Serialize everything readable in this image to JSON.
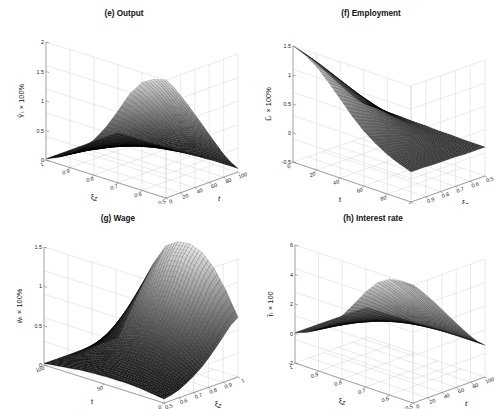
{
  "figure": {
    "background": "#ffffff",
    "panel_count": 4,
    "line_color": "#000000"
  },
  "chart_data": [
    {
      "type": "surface",
      "panel_id": "e",
      "title": "(e) Output",
      "zlabel": "Ŷₜ × 100%",
      "zticks": [
        0,
        0.5,
        1,
        1.5,
        2
      ],
      "zlim": [
        0,
        2
      ],
      "xlabel": "ξ_Z",
      "xticks": [
        1,
        0.9,
        0.8,
        0.7,
        0.6,
        0.5
      ],
      "xlim": [
        1,
        0.5
      ],
      "ylabel": "t",
      "yticks": [
        0,
        20,
        40,
        60,
        80,
        100
      ],
      "ylim": [
        0,
        100
      ],
      "orientation": "xi-left-t-right",
      "description": "Impulse response surface rising steeply from 0 to about 2 as xi_Z decreases toward 0.5, decaying over t",
      "surface_z": [
        [
          0.02,
          0.02,
          0.02,
          0.02,
          0.02,
          0.02,
          0.02,
          0.02,
          0.02,
          0.02,
          0.02
        ],
        [
          0.11,
          0.1,
          0.09,
          0.08,
          0.07,
          0.06,
          0.05,
          0.04,
          0.03,
          0.02,
          0.02
        ],
        [
          0.23,
          0.21,
          0.19,
          0.17,
          0.14,
          0.12,
          0.1,
          0.07,
          0.05,
          0.03,
          0.02
        ],
        [
          0.39,
          0.36,
          0.32,
          0.28,
          0.24,
          0.2,
          0.16,
          0.12,
          0.08,
          0.05,
          0.02
        ],
        [
          0.6,
          0.55,
          0.49,
          0.43,
          0.37,
          0.31,
          0.24,
          0.18,
          0.12,
          0.07,
          0.03
        ],
        [
          0.88,
          0.8,
          0.72,
          0.63,
          0.54,
          0.45,
          0.35,
          0.26,
          0.17,
          0.09,
          0.03
        ],
        [
          1.22,
          1.12,
          1.0,
          0.88,
          0.75,
          0.62,
          0.49,
          0.36,
          0.24,
          0.13,
          0.04
        ],
        [
          1.58,
          1.45,
          1.3,
          1.14,
          0.98,
          0.81,
          0.64,
          0.47,
          0.31,
          0.16,
          0.05
        ],
        [
          1.83,
          1.68,
          1.51,
          1.33,
          1.14,
          0.94,
          0.74,
          0.55,
          0.36,
          0.19,
          0.06
        ],
        [
          1.95,
          1.79,
          1.61,
          1.41,
          1.21,
          1.0,
          0.79,
          0.58,
          0.38,
          0.2,
          0.06
        ],
        [
          2.0,
          1.84,
          1.65,
          1.45,
          1.24,
          1.03,
          0.81,
          0.6,
          0.39,
          0.21,
          0.06
        ]
      ]
    },
    {
      "type": "surface",
      "panel_id": "f",
      "title": "(f) Employment",
      "zlabel": "L̂ₜ × 100%",
      "zticks": [
        -0.5,
        0,
        0.5,
        1,
        1.5
      ],
      "zlim": [
        -0.5,
        1.5
      ],
      "xlabel": "t",
      "xticks": [
        0,
        20,
        40,
        60,
        80,
        100
      ],
      "xlim": [
        0,
        100
      ],
      "ylabel": "ξ_Z",
      "yticks": [
        1,
        0.9,
        0.8,
        0.7,
        0.6,
        0.5
      ],
      "ylim": [
        1,
        0.5
      ],
      "orientation": "t-left-xi-right",
      "description": "Employment response surface peaking near 1.5 at early t and low xi_Z, flattening to near zero",
      "surface_z": [
        [
          1.5,
          1.38,
          1.24,
          1.09,
          0.93,
          0.77,
          0.61,
          0.45,
          0.29,
          0.15,
          0.04
        ],
        [
          1.42,
          1.3,
          1.17,
          1.03,
          0.88,
          0.73,
          0.57,
          0.42,
          0.27,
          0.14,
          0.04
        ],
        [
          1.28,
          1.17,
          1.05,
          0.92,
          0.79,
          0.65,
          0.51,
          0.38,
          0.24,
          0.12,
          0.03
        ],
        [
          1.08,
          0.99,
          0.89,
          0.78,
          0.66,
          0.55,
          0.43,
          0.31,
          0.2,
          0.1,
          0.03
        ],
        [
          0.86,
          0.79,
          0.7,
          0.62,
          0.53,
          0.43,
          0.34,
          0.25,
          0.16,
          0.08,
          0.02
        ],
        [
          0.64,
          0.58,
          0.52,
          0.46,
          0.39,
          0.32,
          0.25,
          0.18,
          0.12,
          0.06,
          0.02
        ],
        [
          0.45,
          0.41,
          0.37,
          0.32,
          0.27,
          0.23,
          0.18,
          0.13,
          0.08,
          0.04,
          0.01
        ],
        [
          0.3,
          0.27,
          0.24,
          0.21,
          0.18,
          0.15,
          0.12,
          0.08,
          0.05,
          0.03,
          0.01
        ],
        [
          0.18,
          0.16,
          0.15,
          0.13,
          0.11,
          0.09,
          0.07,
          0.05,
          0.03,
          0.02,
          0.0
        ],
        [
          0.09,
          0.08,
          0.07,
          0.06,
          0.05,
          0.04,
          0.03,
          0.02,
          0.01,
          0.01,
          0.0
        ],
        [
          0.02,
          0.02,
          0.02,
          0.01,
          0.01,
          0.01,
          0.01,
          0.0,
          0.0,
          0.0,
          0.0
        ]
      ]
    },
    {
      "type": "surface",
      "panel_id": "g",
      "title": "(g) Wage",
      "zlabel": "ŵₜ × 100%",
      "zticks": [
        0,
        0.5,
        1,
        1.5
      ],
      "zlim": [
        0,
        1.5
      ],
      "xlabel": "t",
      "xticks": [
        100,
        50,
        0
      ],
      "xlim": [
        100,
        0
      ],
      "ylabel": "ξ_Z",
      "yticks": [
        0.5,
        0.6,
        0.7,
        0.8,
        0.9,
        1
      ],
      "ylim": [
        0.5,
        1
      ],
      "orientation": "t-left-reversed-xi-right",
      "description": "Wage response surface rising sharply to about 1.5 at small t and low xi_Z, with a steep cliff face",
      "surface_z": [
        [
          0.02,
          0.02,
          0.02,
          0.02,
          0.02,
          0.02,
          0.02,
          0.02,
          0.02,
          0.02,
          0.02
        ],
        [
          0.04,
          0.05,
          0.06,
          0.08,
          0.1,
          0.13,
          0.17,
          0.22,
          0.28,
          0.34,
          0.4
        ],
        [
          0.06,
          0.08,
          0.11,
          0.15,
          0.2,
          0.26,
          0.34,
          0.44,
          0.55,
          0.67,
          0.78
        ],
        [
          0.08,
          0.11,
          0.15,
          0.21,
          0.29,
          0.38,
          0.5,
          0.64,
          0.8,
          0.97,
          1.12
        ],
        [
          0.09,
          0.13,
          0.19,
          0.26,
          0.36,
          0.48,
          0.63,
          0.81,
          1.0,
          1.21,
          1.38
        ],
        [
          0.1,
          0.14,
          0.21,
          0.29,
          0.4,
          0.54,
          0.71,
          0.9,
          1.12,
          1.34,
          1.48
        ],
        [
          0.1,
          0.15,
          0.21,
          0.3,
          0.42,
          0.56,
          0.73,
          0.93,
          1.15,
          1.37,
          1.5
        ],
        [
          0.1,
          0.14,
          0.2,
          0.29,
          0.4,
          0.54,
          0.7,
          0.89,
          1.1,
          1.31,
          1.44
        ],
        [
          0.09,
          0.13,
          0.18,
          0.26,
          0.36,
          0.48,
          0.63,
          0.8,
          0.98,
          1.17,
          1.29
        ],
        [
          0.07,
          0.1,
          0.15,
          0.21,
          0.29,
          0.39,
          0.51,
          0.65,
          0.8,
          0.95,
          1.05
        ],
        [
          0.05,
          0.07,
          0.1,
          0.15,
          0.21,
          0.28,
          0.37,
          0.47,
          0.58,
          0.69,
          0.76
        ]
      ]
    },
    {
      "type": "surface",
      "panel_id": "h",
      "title": "(h) Interest rate",
      "zlabel": "r̂ₜ × 100",
      "zticks": [
        -2,
        0,
        2,
        4,
        6
      ],
      "zlim": [
        -2,
        6
      ],
      "xlabel": "ξ_Z",
      "xticks": [
        1,
        0.9,
        0.8,
        0.7,
        0.6,
        0.5
      ],
      "xlim": [
        1,
        0.5
      ],
      "ylabel": "t",
      "yticks": [
        0,
        20,
        40,
        60,
        80,
        100
      ],
      "ylim": [
        0,
        100
      ],
      "orientation": "xi-left-t-right",
      "description": "Interest rate response surface rising to about 6 at low xi_Z and early t, decaying along t",
      "surface_z": [
        [
          0.05,
          0.05,
          0.05,
          0.05,
          0.04,
          0.04,
          0.03,
          0.03,
          0.02,
          0.01,
          0.0
        ],
        [
          0.35,
          0.32,
          0.28,
          0.25,
          0.21,
          0.17,
          0.13,
          0.1,
          0.06,
          0.03,
          0.01
        ],
        [
          0.8,
          0.73,
          0.65,
          0.57,
          0.48,
          0.4,
          0.31,
          0.23,
          0.15,
          0.08,
          0.02
        ],
        [
          1.45,
          1.32,
          1.18,
          1.03,
          0.88,
          0.72,
          0.57,
          0.41,
          0.27,
          0.14,
          0.04
        ],
        [
          2.3,
          2.1,
          1.88,
          1.64,
          1.39,
          1.15,
          0.9,
          0.66,
          0.43,
          0.22,
          0.06
        ],
        [
          3.35,
          3.06,
          2.73,
          2.39,
          2.03,
          1.67,
          1.31,
          0.96,
          0.62,
          0.32,
          0.09
        ],
        [
          4.45,
          4.06,
          3.63,
          3.17,
          2.7,
          2.22,
          1.74,
          1.27,
          0.83,
          0.42,
          0.12
        ],
        [
          5.35,
          4.88,
          4.36,
          3.81,
          3.24,
          2.67,
          2.09,
          1.53,
          0.99,
          0.51,
          0.14
        ],
        [
          5.85,
          5.34,
          4.77,
          4.17,
          3.55,
          2.92,
          2.29,
          1.67,
          1.09,
          0.56,
          0.15
        ],
        [
          6.0,
          5.48,
          4.89,
          4.28,
          3.64,
          2.99,
          2.35,
          1.72,
          1.11,
          0.57,
          0.16
        ],
        [
          6.0,
          5.48,
          4.89,
          4.28,
          3.64,
          2.99,
          2.35,
          1.72,
          1.11,
          0.57,
          0.16
        ]
      ]
    }
  ]
}
